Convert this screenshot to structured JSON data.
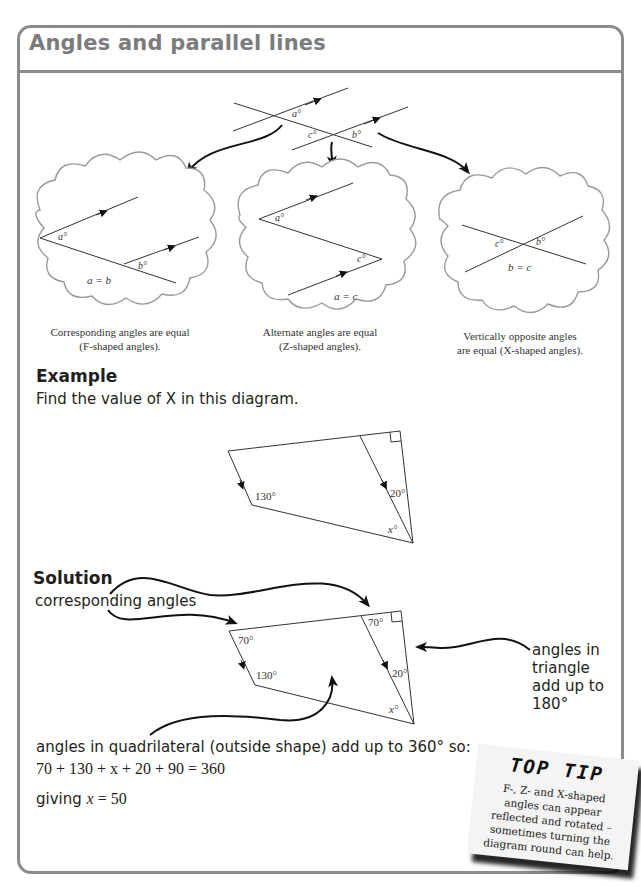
{
  "page": {
    "title": "Angles and parallel lines"
  },
  "intro_diagram": {
    "labels": {
      "a": "a°",
      "b": "b°",
      "c": "c°"
    }
  },
  "clouds": [
    {
      "name": "corresponding",
      "labels": [
        "a°",
        "b°"
      ],
      "equation": "a = b",
      "caption_line1": "Corresponding angles are equal",
      "caption_line2": "(F-shaped angles)."
    },
    {
      "name": "alternate",
      "labels": [
        "a°",
        "c°"
      ],
      "equation": "a = c",
      "caption_line1": "Alternate angles are equal",
      "caption_line2": "(Z-shaped angles)."
    },
    {
      "name": "vertically-opposite",
      "labels": [
        "c°",
        "b°"
      ],
      "equation": "b = c",
      "caption_line1": "Vertically opposite angles",
      "caption_line2": "are equal (X-shaped angles)."
    }
  ],
  "example": {
    "heading": "Example",
    "prompt": "Find the value of X in this diagram.",
    "labels": {
      "angle1": "130°",
      "angle2": "20°",
      "angle3": "x°"
    }
  },
  "solution": {
    "heading": "Solution",
    "annotation_corresponding": "corresponding angles",
    "labels": {
      "tl": "70°",
      "tr": "70°",
      "angle1": "130°",
      "angle2": "20°",
      "angle3": "x°"
    },
    "annotation_triangle": [
      "angles in",
      "triangle",
      "add up to",
      "180°"
    ],
    "quadrilateral_text": "angles in quadrilateral (outside shape) add up to 360° so:",
    "equation": "70 + 130 + x + 20 + 90 = 360",
    "result_prefix": "giving ",
    "result_var": "x",
    "result_suffix": " = 50"
  },
  "top_tip": {
    "title": "TOP TIP",
    "lines": [
      "F-, Z- and X-shaped",
      "angles can appear",
      "reflected and rotated –",
      "sometimes turning the",
      "diagram round can help."
    ]
  },
  "colors": {
    "frame": "#8a8b8d",
    "title": "#7b7c7e",
    "text": "#231f20",
    "cloud_outline": "#9a9a9a"
  }
}
